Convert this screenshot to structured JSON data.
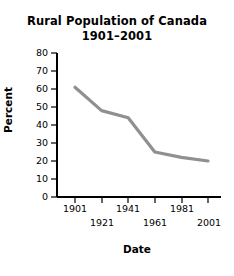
{
  "chart_data": {
    "type": "line",
    "title": "Rural Population of Canada",
    "subtitle": "1901–2001",
    "xlabel": "Date",
    "ylabel": "Percent",
    "x": [
      1901,
      1921,
      1941,
      1961,
      1981,
      2001
    ],
    "values": [
      61,
      48,
      44,
      25,
      22,
      20
    ],
    "series": [
      {
        "name": "Rural population percent",
        "values": [
          61,
          48,
          44,
          25,
          22,
          20
        ],
        "color": "#909090"
      }
    ],
    "xlim": [
      1901,
      2001
    ],
    "ylim": [
      0,
      80
    ],
    "ytick_labels": [
      "80",
      "70",
      "60",
      "50",
      "40",
      "30",
      "20",
      "10",
      "0"
    ],
    "yticks": [
      80,
      70,
      60,
      50,
      40,
      30,
      20,
      10,
      0
    ],
    "xtick_labels": [
      "1901",
      "1921",
      "1941",
      "1961",
      "1981",
      "2001"
    ],
    "grid": false,
    "legend": "none",
    "line_color": "#909090",
    "axis_color": "#000000"
  }
}
